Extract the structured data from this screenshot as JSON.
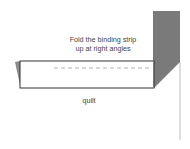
{
  "diagram": {
    "instruction_line1": "Fold the binding strip",
    "instruction_line2": "up at right angles",
    "quilt_label": "quilt",
    "colors": {
      "strip_fill": "#7a7a7a",
      "outline": "#333333",
      "dash": "#9a9a9a",
      "text": "#444444",
      "edge_line": "#aaaaaa"
    }
  }
}
